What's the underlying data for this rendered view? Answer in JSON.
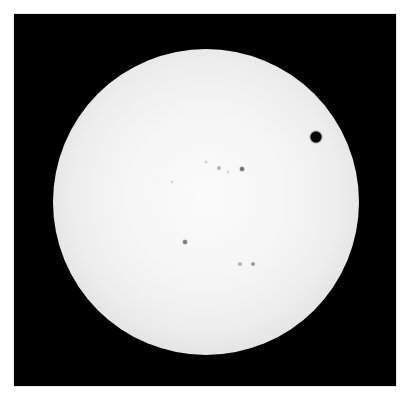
{
  "image": {
    "subject": "Transit of Venus across the solar disk",
    "background_color": "#000000",
    "page_color": "#ffffff"
  },
  "sun": {
    "center": [
      206,
      202
    ],
    "radius": 153,
    "center_color": "#fbfbfb",
    "limb_color": "#8a8a8a"
  },
  "venus": {
    "center": [
      316,
      137
    ],
    "diameter": 11,
    "color": "#050505"
  },
  "sunspots": [
    {
      "x": 242,
      "y": 169,
      "size": 4,
      "color": "#6f6f6f"
    },
    {
      "x": 219,
      "y": 168,
      "size": 3,
      "color": "#a8a8a8"
    },
    {
      "x": 206,
      "y": 162,
      "size": 2,
      "color": "#c8c8c8"
    },
    {
      "x": 228,
      "y": 172,
      "size": 2,
      "color": "#cfcfcf"
    },
    {
      "x": 172,
      "y": 182,
      "size": 2,
      "color": "#d0d0d0"
    },
    {
      "x": 185,
      "y": 242,
      "size": 4,
      "color": "#7a7a7a"
    },
    {
      "x": 240,
      "y": 264,
      "size": 3,
      "color": "#a6a6a6"
    },
    {
      "x": 253,
      "y": 264,
      "size": 3,
      "color": "#8c8c8c"
    }
  ]
}
